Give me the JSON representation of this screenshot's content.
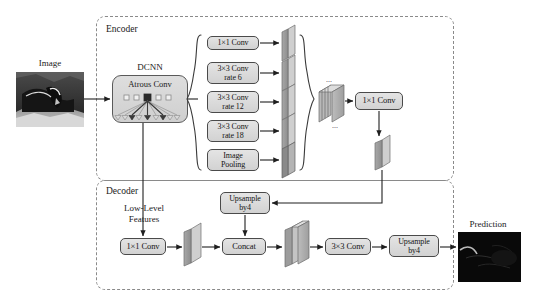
{
  "figure": {
    "type": "diagram"
  },
  "regions": {
    "encoder": {
      "label": "Encoder"
    },
    "decoder": {
      "label": "Decoder"
    }
  },
  "input": {
    "label": "Image",
    "icon": "grayscale-photo-thumbnail"
  },
  "output": {
    "label": "Prediction",
    "icon": "segmentation-mask-thumbnail"
  },
  "backbone": {
    "title": "DCNN",
    "inner_label": "Atrous Conv",
    "icon": "atrous-convolution-diagram"
  },
  "aspp": {
    "brace_left": "{",
    "brace_right": "}",
    "branches": [
      {
        "label": "1×1 Conv"
      },
      {
        "label": "3×3 Conv\nrate 6",
        "line1": "3×3 Conv",
        "line2": "rate 6"
      },
      {
        "label": "3×3 Conv\nrate 12",
        "line1": "3×3 Conv",
        "line2": "rate 12"
      },
      {
        "label": "3×3 Conv\nrate 18",
        "line1": "3×3 Conv",
        "line2": "rate 18"
      },
      {
        "label": "Image\nPooling",
        "line1": "Image",
        "line2": "Pooling"
      }
    ],
    "concat_stack_dots_top": "...",
    "concat_stack_dots_bottom": "...",
    "projection": {
      "label": "1×1 Conv"
    }
  },
  "decoder_path": {
    "low_level_label_line1": "Low-Level",
    "low_level_label_line2": "Features",
    "low_level_conv": {
      "label": "1×1 Conv"
    },
    "upsample_top": {
      "line1": "Upsample",
      "line2": "by4"
    },
    "concat": {
      "label": "Concat"
    },
    "refine_conv": {
      "label": "3×3 Conv"
    },
    "upsample_final": {
      "line1": "Upsample",
      "line2": "by4"
    }
  },
  "colors": {
    "box_border": "#4a4a4a",
    "box_fill_top": "#e4e4e4",
    "box_fill_bottom": "#d2d2d2",
    "region_border": "#8a8a8a",
    "arrow": "#2a2a2a",
    "slab_face": "#9a9a9a",
    "slab_side": "#c9c9c9",
    "text": "#1a1a1a"
  }
}
